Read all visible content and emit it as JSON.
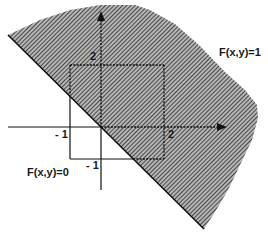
{
  "figure": {
    "type": "region-diagram",
    "colors": {
      "hatch": "#3a3a3a",
      "hatch_bg": "#9a9a9a",
      "axis": "#111111",
      "background": "#ffffff"
    },
    "labels": {
      "region_one": "F(x,y)=1",
      "region_zero": "F(x,y)=0"
    },
    "ticks": {
      "x_neg": "- 1",
      "x_pos": "2",
      "y_neg": "- 1",
      "y_pos": "2"
    },
    "square": {
      "x_min": -1,
      "x_max": 2,
      "y_min": -1,
      "y_max": 2
    },
    "boundary_line": "x + y = 0"
  }
}
